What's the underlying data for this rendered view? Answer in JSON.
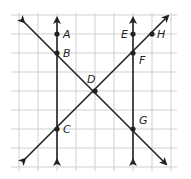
{
  "diagram": {
    "type": "geometry-grid",
    "grid": {
      "spacing": 19,
      "x_lines": [
        19,
        38,
        57,
        76,
        95,
        114,
        133,
        152,
        171
      ],
      "y_lines": [
        15,
        34,
        53,
        72,
        91,
        110,
        129,
        148,
        167
      ],
      "color": "#cfcfcf"
    },
    "line_color": "#222222",
    "points": [
      {
        "id": "A",
        "label": "A",
        "x": 57,
        "y": 34,
        "lx": 63,
        "ly": 38
      },
      {
        "id": "B",
        "label": "B",
        "x": 57,
        "y": 53,
        "lx": 63,
        "ly": 57
      },
      {
        "id": "C",
        "label": "C",
        "x": 57,
        "y": 129,
        "lx": 63,
        "ly": 133
      },
      {
        "id": "D",
        "label": "D",
        "x": 95,
        "y": 91,
        "lx": 87,
        "ly": 83
      },
      {
        "id": "E",
        "label": "E",
        "x": 133,
        "y": 34,
        "lx": 121,
        "ly": 38
      },
      {
        "id": "F",
        "label": "F",
        "x": 133,
        "y": 53,
        "lx": 139,
        "ly": 64
      },
      {
        "id": "G",
        "label": "G",
        "x": 133,
        "y": 129,
        "lx": 139,
        "ly": 124
      },
      {
        "id": "H",
        "label": "H",
        "x": 152,
        "y": 34,
        "lx": 157,
        "ly": 38
      }
    ],
    "lines": [
      {
        "name": "line-ABC",
        "x1": 57,
        "y1": 160,
        "x2": 57,
        "y2": 18
      },
      {
        "name": "line-EFG",
        "x1": 133,
        "y1": 160,
        "x2": 133,
        "y2": 18
      },
      {
        "name": "line-BDG",
        "x1": 24,
        "y1": 22,
        "x2": 166,
        "y2": 164
      },
      {
        "name": "line-CDFH",
        "x1": 25,
        "y1": 159,
        "x2": 168,
        "y2": 16
      }
    ]
  }
}
